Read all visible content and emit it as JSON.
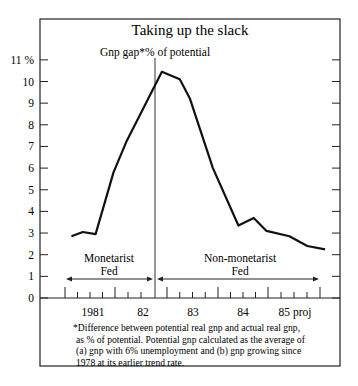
{
  "chart_data": {
    "type": "line",
    "title": "Taking up the slack",
    "subtitle": "Gnp gap*% of potential",
    "xlabel": "",
    "ylabel": "",
    "ylim": [
      0,
      11
    ],
    "yticks": [
      0,
      1,
      2,
      3,
      4,
      5,
      6,
      7,
      8,
      9,
      10,
      11
    ],
    "ytick_labels": [
      "0",
      "1",
      "2",
      "3",
      "4",
      "5",
      "6",
      "7",
      "8",
      "9",
      "10",
      "11 %"
    ],
    "xtick_labels": [
      "1981",
      "82",
      "83",
      "84",
      "85 proj"
    ],
    "grid": false,
    "legend": null,
    "series": [
      {
        "name": "Gnp gap % of potential",
        "x": [
          1980.625,
          1980.85,
          1981.1,
          1981.45,
          1981.7,
          1982.4,
          1982.75,
          1982.95,
          1983.4,
          1983.9,
          1984.2,
          1984.45,
          1984.9,
          1985.25,
          1985.6
        ],
        "values": [
          2.85,
          3.05,
          2.95,
          5.8,
          7.2,
          10.45,
          10.1,
          9.2,
          6.0,
          3.35,
          3.7,
          3.1,
          2.85,
          2.4,
          2.25
        ]
      }
    ],
    "annotations": [
      {
        "text": "Monetarist Fed",
        "span": "start to divider"
      },
      {
        "text": "Non-monetarist Fed",
        "span": "divider to end"
      }
    ],
    "footnote": [
      "*Difference between potential real gnp and actual real gnp,",
      "as % of potential. Potential gnp calculated as the average of",
      "(a) gnp with 6% unemployment and (b) gnp growing since",
      "1978 at its earlier trend rate."
    ]
  },
  "labels": {
    "title": "Taking up the slack",
    "subtitle": "Gnp gap*% of potential",
    "region_left_1": "Monetarist",
    "region_left_2": "Fed",
    "region_right_1": "Non-monetarist",
    "region_right_2": "Fed"
  }
}
